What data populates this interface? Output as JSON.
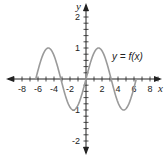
{
  "chart_data": {
    "type": "line",
    "title": "",
    "xlabel": "x",
    "ylabel": "y",
    "xlim": [
      -9,
      9
    ],
    "ylim": [
      -2.4,
      2.4
    ],
    "grid": false,
    "legend": "none",
    "x_ticks": [
      -8,
      -6,
      -4,
      -2,
      2,
      4,
      6,
      8
    ],
    "y_ticks": [
      -2,
      -1,
      1,
      2
    ],
    "annotations": [
      {
        "text": "y = f(x)",
        "x": 4.5,
        "y": 0.75
      }
    ],
    "series": [
      {
        "name": "y = f(x)",
        "function": "sin(x)",
        "x": [
          -6.28,
          -5.5,
          -4.71,
          -3.93,
          -3.14,
          -2.36,
          -1.57,
          -0.79,
          0,
          0.79,
          1.57,
          2.36,
          3.14,
          3.93,
          4.71,
          5.5,
          6.28
        ],
        "values": [
          0,
          0.71,
          1,
          0.71,
          0,
          -0.71,
          -1,
          -0.71,
          0,
          0.71,
          1,
          0.71,
          0,
          -0.71,
          -1,
          -0.71,
          0
        ]
      }
    ],
    "colors": {
      "curve": "#9a9a9a",
      "axes": "#222222"
    }
  },
  "labels": {
    "x_axis": "x",
    "y_axis": "y",
    "curve": "y = f(x)",
    "x_ticks": [
      "-8",
      "-6",
      "-4",
      "-2",
      "2",
      "4",
      "6",
      "8"
    ],
    "y_ticks": [
      "2",
      "1",
      "-1",
      "-2"
    ]
  }
}
